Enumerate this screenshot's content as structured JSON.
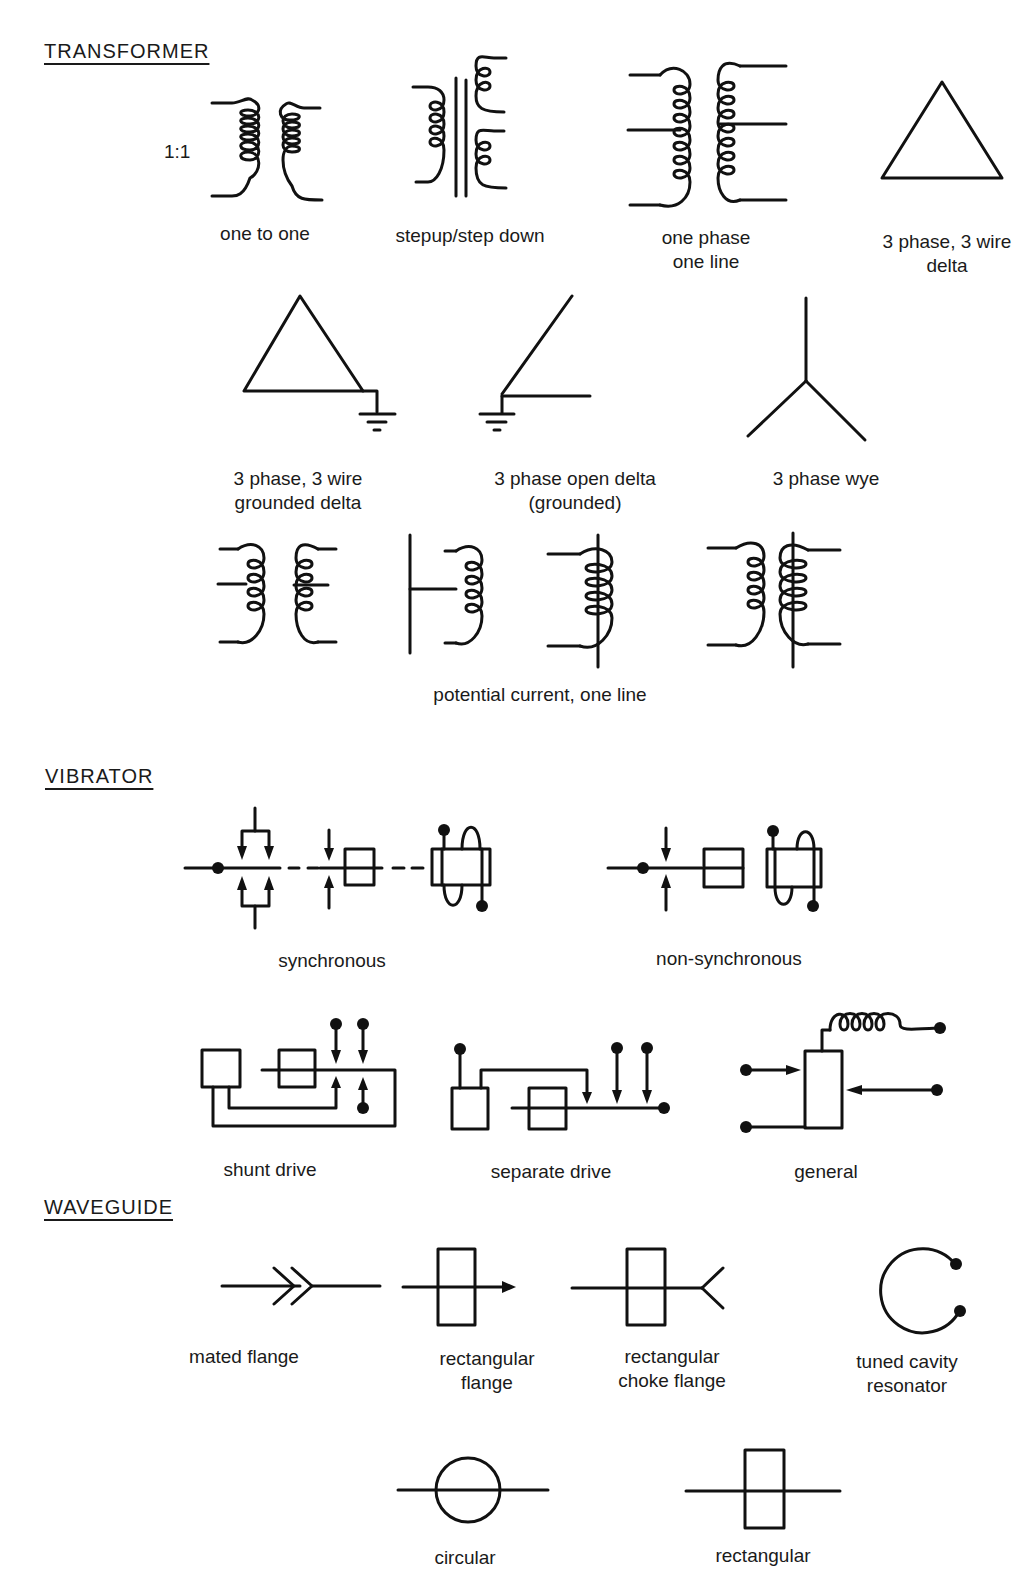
{
  "sections": [
    {
      "heading": "TRANSFORMER",
      "ratio_label": "1:1",
      "symbols": [
        {
          "id": "one-to-one",
          "label": "one to one"
        },
        {
          "id": "stepup-step-down",
          "label": "stepup/step down"
        },
        {
          "id": "one-phase-one-line",
          "label_lines": [
            "one phase",
            "one line"
          ]
        },
        {
          "id": "three-phase-delta",
          "label_lines": [
            "3 phase, 3 wire",
            "delta"
          ]
        },
        {
          "id": "grounded-delta",
          "label_lines": [
            "3 phase, 3 wire",
            "grounded delta"
          ]
        },
        {
          "id": "open-delta-grounded",
          "label_lines": [
            "3 phase open delta",
            "(grounded)"
          ]
        },
        {
          "id": "three-phase-wye",
          "label": "3 phase wye"
        },
        {
          "id": "potential-current-one-line",
          "label": "potential current, one line"
        }
      ]
    },
    {
      "heading": "VIBRATOR",
      "symbols": [
        {
          "id": "synchronous",
          "label": "synchronous"
        },
        {
          "id": "non-synchronous",
          "label": "non-synchronous"
        },
        {
          "id": "shunt-drive",
          "label": "shunt drive"
        },
        {
          "id": "separate-drive",
          "label": "separate drive"
        },
        {
          "id": "general",
          "label": "general"
        }
      ]
    },
    {
      "heading": "WAVEGUIDE",
      "symbols": [
        {
          "id": "mated-flange",
          "label": "mated flange"
        },
        {
          "id": "rectangular-flange",
          "label_lines": [
            "rectangular",
            "flange"
          ]
        },
        {
          "id": "rectangular-choke-flange",
          "label_lines": [
            "rectangular",
            "choke flange"
          ]
        },
        {
          "id": "tuned-cavity-resonator",
          "label_lines": [
            "tuned cavity",
            "resonator"
          ]
        },
        {
          "id": "circular",
          "label": "circular"
        },
        {
          "id": "rectangular",
          "label": "rectangular"
        }
      ]
    }
  ]
}
